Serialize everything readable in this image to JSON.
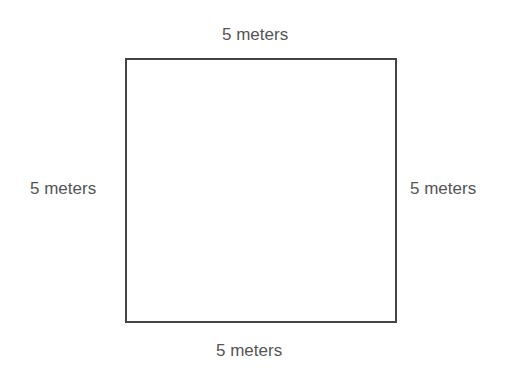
{
  "diagram": {
    "shape": "square",
    "labels": {
      "top": "5 meters",
      "bottom": "5 meters",
      "left": "5 meters",
      "right": "5 meters"
    },
    "colors": {
      "stroke": "#444444",
      "text": "#555555",
      "background": "#ffffff"
    }
  }
}
